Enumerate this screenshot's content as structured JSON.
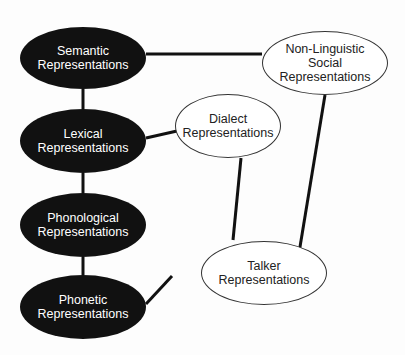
{
  "diagram": {
    "colors": {
      "dark_node": "#111111",
      "dark_text": "#ffffff",
      "light_node": "#ffffff",
      "light_text": "#222222",
      "edge": "#111111"
    },
    "nodes": [
      {
        "id": "semantic",
        "label": "Semantic\nRepresentations",
        "style": "dark",
        "cx": 83,
        "cy": 58,
        "rx": 63,
        "ry": 31
      },
      {
        "id": "lexical",
        "label": "Lexical\nRepresentations",
        "style": "dark",
        "cx": 83,
        "cy": 141,
        "rx": 63,
        "ry": 32
      },
      {
        "id": "phonological",
        "label": "Phonological\nRepresentations",
        "style": "dark",
        "cx": 83,
        "cy": 225,
        "rx": 63,
        "ry": 32
      },
      {
        "id": "phonetic",
        "label": "Phonetic\nRepresentations",
        "style": "dark",
        "cx": 83,
        "cy": 307,
        "rx": 63,
        "ry": 32
      },
      {
        "id": "social",
        "label": "Non-Linguistic\nSocial\nRepresentations",
        "style": "light",
        "cx": 325,
        "cy": 63,
        "rx": 63,
        "ry": 32
      },
      {
        "id": "dialect",
        "label": "Dialect\nRepresentations",
        "style": "light",
        "cx": 228,
        "cy": 126,
        "rx": 53,
        "ry": 32
      },
      {
        "id": "talker",
        "label": "Talker\nRepresentations",
        "style": "light",
        "cx": 264,
        "cy": 273,
        "rx": 63,
        "ry": 32
      }
    ],
    "edges": [
      {
        "from": "semantic",
        "to": "social",
        "x1": 146,
        "y1": 54,
        "x2": 262,
        "y2": 54
      },
      {
        "from": "semantic",
        "to": "lexical",
        "x1": 83,
        "y1": 89,
        "x2": 83,
        "y2": 109
      },
      {
        "from": "lexical",
        "to": "dialect",
        "x1": 146,
        "y1": 138,
        "x2": 177,
        "y2": 131
      },
      {
        "from": "lexical",
        "to": "phonological",
        "x1": 83,
        "y1": 173,
        "x2": 83,
        "y2": 193
      },
      {
        "from": "phonological",
        "to": "phonetic",
        "x1": 83,
        "y1": 257,
        "x2": 83,
        "y2": 275
      },
      {
        "from": "phonetic",
        "to": "talker",
        "x1": 146,
        "y1": 304,
        "x2": 172,
        "y2": 276
      },
      {
        "from": "dialect",
        "to": "talker",
        "x1": 241,
        "y1": 158,
        "x2": 233,
        "y2": 240
      },
      {
        "from": "social",
        "to": "talker",
        "x1": 325,
        "y1": 95,
        "x2": 298,
        "y2": 259
      }
    ]
  }
}
